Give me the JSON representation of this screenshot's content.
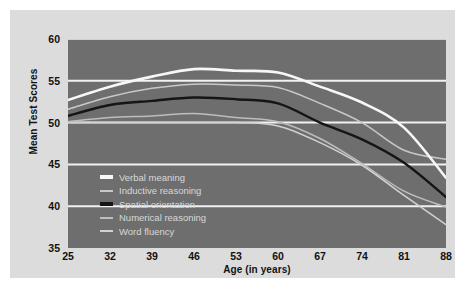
{
  "chart_data": {
    "type": "line",
    "title": "",
    "xlabel": "Age (in years)",
    "ylabel": "Mean Test Scores",
    "xlim": [
      25,
      88
    ],
    "ylim": [
      35,
      60
    ],
    "yticks": [
      60,
      55,
      50,
      45,
      40,
      35
    ],
    "xticks": [
      25,
      32,
      39,
      46,
      53,
      60,
      67,
      74,
      81,
      88
    ],
    "x": [
      25,
      32,
      39,
      46,
      53,
      60,
      67,
      74,
      81,
      88
    ],
    "grid": true,
    "grid_color": "#f2f2f2",
    "plot_background": "#6e6e6e",
    "legend_position": "lower-left-inside",
    "series": [
      {
        "name": "Verbal meaning",
        "color": "#f7f7f7",
        "width": 2.6,
        "values": [
          52.7,
          54.3,
          55.5,
          56.4,
          56.2,
          56.0,
          54.3,
          52.4,
          49.4,
          43.4
        ]
      },
      {
        "name": "Inductive reasoning",
        "color": "#c8c8c8",
        "width": 1.5,
        "values": [
          51.6,
          53.1,
          54.1,
          54.6,
          54.5,
          54.2,
          52.3,
          50.0,
          46.7,
          45.6
        ]
      },
      {
        "name": "Spatial orientation",
        "color": "#151515",
        "width": 2.4,
        "values": [
          50.8,
          52.1,
          52.6,
          53.0,
          52.8,
          52.3,
          50.0,
          48.0,
          45.2,
          41.1
        ]
      },
      {
        "name": "Numerical reasoning",
        "color": "#bdbdbd",
        "width": 1.5,
        "values": [
          50.1,
          50.6,
          50.8,
          51.1,
          50.6,
          50.1,
          48.1,
          45.1,
          41.8,
          39.9
        ]
      },
      {
        "name": "Word fluency",
        "color": "#d2d2d2",
        "width": 1.5,
        "values": [
          50.0,
          50.0,
          50.0,
          50.0,
          50.0,
          49.6,
          47.6,
          44.9,
          41.3,
          37.8
        ]
      }
    ]
  },
  "legend": {
    "items": [
      {
        "label": "Verbal meaning"
      },
      {
        "label": "Inductive reasoning"
      },
      {
        "label": "Spatial orientation"
      },
      {
        "label": "Numerical reasoning"
      },
      {
        "label": "Word fluency"
      }
    ]
  }
}
